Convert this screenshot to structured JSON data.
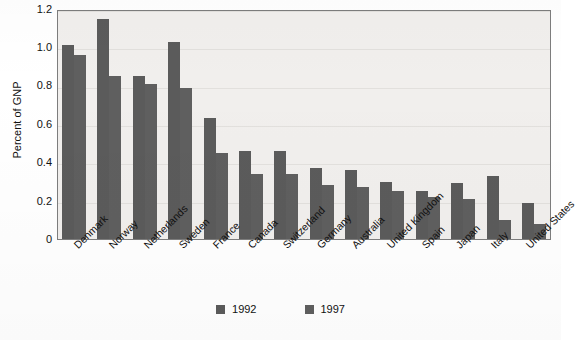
{
  "chart_data": {
    "type": "bar",
    "title": "",
    "subtitle": "",
    "xlabel": "",
    "ylabel": "Percent of GNP",
    "ylim": [
      0,
      1.2
    ],
    "yticks": [
      "1.2",
      "1.0",
      "0.8",
      "0.6",
      "0.4",
      "0.2",
      "0"
    ],
    "ytick_values": [
      1.2,
      1.0,
      0.8,
      0.6,
      0.4,
      0.2,
      0
    ],
    "grid": true,
    "legend_position": "bottom-center",
    "categories": [
      "Denmark",
      "Norway",
      "Netherlands",
      "Sweden",
      "France",
      "Canada",
      "Switzerland",
      "Germany",
      "Australia",
      "United Kingdom",
      "Spain",
      "Japan",
      "Italy",
      "United States"
    ],
    "series": [
      {
        "name": "1992",
        "color": "#5b5b5b",
        "values": [
          1.01,
          1.15,
          0.85,
          1.03,
          0.63,
          0.46,
          0.46,
          0.37,
          0.36,
          0.3,
          0.25,
          0.29,
          0.33,
          0.19
        ]
      },
      {
        "name": "1997",
        "color": "#5f5f5f",
        "values": [
          0.96,
          0.85,
          0.81,
          0.79,
          0.45,
          0.34,
          0.34,
          0.28,
          0.27,
          0.25,
          0.22,
          0.21,
          0.1,
          0.08
        ]
      }
    ]
  },
  "legend": {
    "items": [
      {
        "label": "1992",
        "color": "#5b5b5b"
      },
      {
        "label": "1997",
        "color": "#5f5f5f"
      }
    ]
  },
  "colors": {
    "bar_1992": "#5b5b5b",
    "bar_1997": "#5f5f5f",
    "plot_background": "#f1efed",
    "frame": "#7d7d7d",
    "text": "#111111"
  }
}
